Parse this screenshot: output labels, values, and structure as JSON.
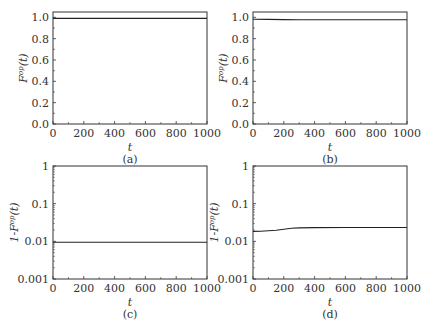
{
  "chart_data": [
    {
      "panel": "(a)",
      "type": "line",
      "xlabel": "t",
      "ylabel": "F^op(t)",
      "ylabel_base": "F",
      "ylabel_sup": "op",
      "ylabel_arg": "(t)",
      "xlim": [
        0,
        1000
      ],
      "ylim": [
        0,
        1.05
      ],
      "yscale": "linear",
      "xticks": [
        "0",
        "200",
        "400",
        "600",
        "800",
        "1000"
      ],
      "yticks": [
        "0.0",
        "0.2",
        "0.4",
        "0.6",
        "0.8",
        "1.0"
      ],
      "x": [
        0,
        200,
        400,
        600,
        800,
        1000
      ],
      "values": [
        0.99,
        0.99,
        0.99,
        0.99,
        0.99,
        0.99
      ]
    },
    {
      "panel": "(b)",
      "type": "line",
      "xlabel": "t",
      "ylabel": "F^op(t)",
      "ylabel_base": "F",
      "ylabel_sup": "op",
      "ylabel_arg": "(t)",
      "xlim": [
        0,
        1000
      ],
      "ylim": [
        0,
        1.05
      ],
      "yscale": "linear",
      "xticks": [
        "0",
        "200",
        "400",
        "600",
        "800",
        "1000"
      ],
      "yticks": [
        "0.0",
        "0.2",
        "0.4",
        "0.6",
        "0.8",
        "1.0"
      ],
      "x": [
        0,
        100,
        200,
        300,
        400,
        600,
        800,
        1000
      ],
      "values": [
        0.982,
        0.981,
        0.979,
        0.977,
        0.977,
        0.977,
        0.977,
        0.977
      ]
    },
    {
      "panel": "(c)",
      "type": "line",
      "xlabel": "t",
      "ylabel": "1-F^op(t)",
      "ylabel_base": "1-F",
      "ylabel_sup": "op",
      "ylabel_arg": "(t)",
      "xlim": [
        0,
        1000
      ],
      "ylim": [
        0.001,
        1
      ],
      "yscale": "log",
      "xticks": [
        "0",
        "200",
        "400",
        "600",
        "800",
        "1000"
      ],
      "yticks": [
        "0.001",
        "0.01",
        "0.1",
        "1"
      ],
      "x": [
        0,
        200,
        400,
        600,
        800,
        1000
      ],
      "values": [
        0.0095,
        0.0095,
        0.0095,
        0.0095,
        0.0095,
        0.0095
      ]
    },
    {
      "panel": "(d)",
      "type": "line",
      "xlabel": "t",
      "ylabel": "1-F^op(t)",
      "ylabel_base": "1-F",
      "ylabel_sup": "op",
      "ylabel_arg": "(t)",
      "xlim": [
        0,
        1000
      ],
      "ylim": [
        0.001,
        1
      ],
      "yscale": "log",
      "xticks": [
        "0",
        "200",
        "400",
        "600",
        "800",
        "1000"
      ],
      "yticks": [
        "0.001",
        "0.01",
        "0.1",
        "1"
      ],
      "x": [
        0,
        50,
        100,
        150,
        200,
        250,
        300,
        400,
        600,
        800,
        1000
      ],
      "values": [
        0.0183,
        0.0185,
        0.019,
        0.0198,
        0.021,
        0.0222,
        0.0228,
        0.0232,
        0.0233,
        0.0233,
        0.0233
      ]
    }
  ]
}
